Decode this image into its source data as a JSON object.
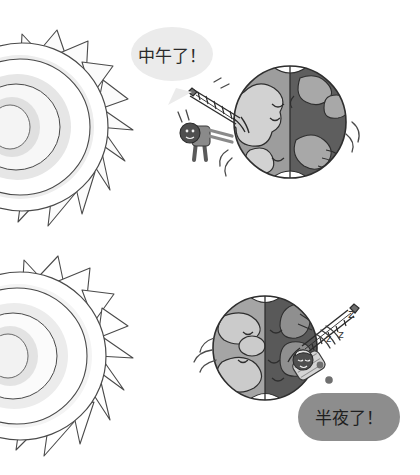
{
  "illustration": {
    "title": "Day and night on Earth comic",
    "background_color": "#ffffff",
    "width": 420,
    "height": 475
  },
  "panels": [
    {
      "id": "noon",
      "label": "Noon panel",
      "sun": {
        "label": "Sun",
        "ray_count": 11,
        "ring_colors": [
          "#ffffff",
          "#ededed",
          "#f7f7f7",
          "#e4e4e4",
          "#f2f2f2"
        ],
        "outline_color": "#3f3f3f"
      },
      "globe": {
        "label": "Earth globe at noon",
        "day_side": "left",
        "night_side": "right",
        "day_color": "#9d9d9d",
        "night_color": "#5e5e5e",
        "land_day_color": "#cfcfcf",
        "land_night_color": "#a8a8a8",
        "polar_cap_color": "#ffffff",
        "outline_color": "#2e2e2e"
      },
      "character": {
        "label": "Awake person standing on Earth",
        "state": "awake",
        "landmark": "Eiffel Tower",
        "body_color": "#7d7d7d",
        "head_color": "#4a4a4a"
      },
      "speech_bubble": {
        "text": "中午了！",
        "translation_note": "It is noon!",
        "fill_color": "#ebebeb",
        "text_color": "#2a2a2a",
        "tail_direction": "down-left"
      }
    },
    {
      "id": "midnight",
      "label": "Midnight panel",
      "sun": {
        "label": "Sun",
        "ray_count": 11,
        "ring_colors": [
          "#ffffff",
          "#f4f4f4",
          "#fbfbfb",
          "#ececec",
          "#f8f8f8"
        ],
        "outline_color": "#3f3f3f"
      },
      "globe": {
        "label": "Earth globe at midnight",
        "day_side": "left",
        "night_side": "right",
        "day_color": "#a5a5a5",
        "night_color": "#595959",
        "land_day_color": "#c9c9c9",
        "land_night_color": "#8f8f8f",
        "polar_cap_color": "#ffffff",
        "outline_color": "#2e2e2e"
      },
      "character": {
        "label": "Sleeping person on Earth",
        "state": "asleep",
        "landmark": "Eiffel Tower",
        "body_color": "#c9c9c9",
        "head_color": "#4a4a4a"
      },
      "sleep_marks": {
        "label": "Snoring z marks",
        "marks": [
          "z",
          "z",
          "z"
        ],
        "color": "#3a3a3a"
      },
      "thought_dots": {
        "label": "Thought trail dots",
        "count": 2,
        "color": "#6f6f6f"
      },
      "speech_bubble": {
        "text": "半夜了！",
        "translation_note": "It is midnight!",
        "fill_color": "#8d8d8d",
        "text_color": "#1f1f1f",
        "tail_direction": "up-left"
      }
    }
  ]
}
